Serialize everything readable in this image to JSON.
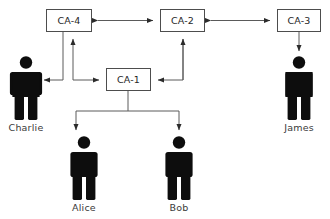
{
  "diagram": {
    "type": "node-link-diagram",
    "colors": {
      "background": "#ffffff",
      "box_fill": "#ffffff",
      "box_stroke": "#4d4d4d",
      "line": "#5a5a5a",
      "person": "#0d0d0d",
      "text": "#262626"
    },
    "ca_nodes": [
      {
        "id": "ca-4",
        "label": "CA-4",
        "x": 46,
        "y": 9,
        "w": 46,
        "h": 23
      },
      {
        "id": "ca-2",
        "label": "CA-2",
        "x": 160,
        "y": 9,
        "w": 45,
        "h": 23
      },
      {
        "id": "ca-3",
        "label": "CA-3",
        "x": 277,
        "y": 9,
        "w": 44,
        "h": 23
      },
      {
        "id": "ca-1",
        "label": "CA-1",
        "x": 106,
        "y": 68,
        "w": 45,
        "h": 23
      }
    ],
    "people": [
      {
        "id": "charlie",
        "label": "Charlie",
        "cx": 26,
        "top": 56,
        "label_y": 131
      },
      {
        "id": "james",
        "label": "James",
        "cx": 299,
        "top": 56,
        "label_y": 131
      },
      {
        "id": "alice",
        "label": "Alice",
        "cx": 84,
        "top": 136,
        "label_y": 211
      },
      {
        "id": "bob",
        "label": "Bob",
        "cx": 179,
        "top": 136,
        "label_y": 211
      }
    ],
    "edges": [
      {
        "id": "ca4-ca2",
        "from": "ca-4",
        "to": "ca-2",
        "direction": "bidirectional"
      },
      {
        "id": "ca2-ca3",
        "from": "ca-2",
        "to": "ca-3",
        "direction": "bidirectional"
      },
      {
        "id": "ca4-charlie",
        "from": "ca-4",
        "to": "charlie",
        "direction": "one-way"
      },
      {
        "id": "ca1-ca4",
        "from": "ca-1",
        "to": "ca-4",
        "direction": "bidirectional"
      },
      {
        "id": "ca2-ca1",
        "from": "ca-2",
        "to": "ca-1",
        "direction": "one-way"
      },
      {
        "id": "ca3-james",
        "from": "ca-3",
        "to": "james",
        "direction": "one-way"
      },
      {
        "id": "ca1-alice",
        "from": "ca-1",
        "to": "alice",
        "direction": "one-way"
      },
      {
        "id": "ca1-bob",
        "from": "ca-1",
        "to": "bob",
        "direction": "one-way"
      }
    ]
  }
}
